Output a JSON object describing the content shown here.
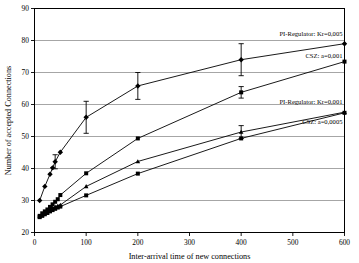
{
  "chart_data": {
    "type": "line",
    "title": "",
    "xlabel": "Inter-arrival time of new connections",
    "ylabel": "Number of accepted Connections",
    "xlim": [
      0,
      600
    ],
    "ylim": [
      20,
      90
    ],
    "xticks": [
      0,
      100,
      200,
      300,
      400,
      500,
      600
    ],
    "yticks": [
      20,
      30,
      40,
      50,
      60,
      70,
      80,
      90
    ],
    "grid": "horizontal",
    "legend_position": "inline-annotations",
    "marker_styles": [
      "diamond",
      "square",
      "triangle",
      "square"
    ],
    "series": [
      {
        "name": "PI-Regulator: Kr=0,005",
        "marker": "diamond",
        "x": [
          10,
          20,
          30,
          35,
          40,
          50,
          100,
          200,
          400,
          600
        ],
        "values": [
          30.0,
          34.4,
          38.2,
          40.2,
          42.1,
          45.1,
          56.0,
          65.8,
          74.0,
          79.0
        ],
        "yerr": [
          0,
          0,
          0,
          0,
          2.2,
          0,
          5.0,
          4.2,
          5.0,
          0
        ]
      },
      {
        "name": "CSZ: a=0,001",
        "marker": "square",
        "x": [
          10,
          15,
          20,
          25,
          30,
          35,
          40,
          45,
          50,
          100,
          200,
          400,
          600
        ],
        "values": [
          25.2,
          26.0,
          26.6,
          27.2,
          28.0,
          28.8,
          29.6,
          30.4,
          31.7,
          38.5,
          49.4,
          63.8,
          73.4
        ],
        "yerr": [
          0,
          0,
          0,
          0,
          0,
          0,
          0,
          0,
          0,
          0,
          0,
          1.8,
          0
        ]
      },
      {
        "name": "PI-Regulator: Kr=0,001",
        "marker": "triangle",
        "x": [
          10,
          15,
          20,
          25,
          30,
          35,
          40,
          45,
          50,
          100,
          200,
          400,
          600
        ],
        "values": [
          25.0,
          25.6,
          26.2,
          26.8,
          27.3,
          27.7,
          28.0,
          28.3,
          28.6,
          34.4,
          42.2,
          51.4,
          57.6
        ],
        "yerr": [
          0,
          0,
          0,
          0,
          0,
          0,
          0,
          0,
          0,
          0,
          0,
          2.0,
          0
        ]
      },
      {
        "name": "CSZ: a=0,0005",
        "marker": "square",
        "x": [
          10,
          15,
          20,
          25,
          30,
          35,
          40,
          45,
          50,
          100,
          200,
          400,
          600
        ],
        "values": [
          24.8,
          25.2,
          25.7,
          26.1,
          26.6,
          27.0,
          27.4,
          27.8,
          28.1,
          31.6,
          38.4,
          49.4,
          57.4
        ],
        "yerr": [
          0,
          0,
          0,
          0,
          0,
          0,
          0,
          0,
          0,
          0,
          0,
          0,
          0
        ]
      }
    ],
    "annotations": [
      {
        "text": "PI-Regulator: Kr=0,005",
        "x": 600,
        "y": 81.5,
        "anchor": "end"
      },
      {
        "text": "CSZ: a=0,001",
        "x": 600,
        "y": 74.6,
        "anchor": "end"
      },
      {
        "text": "PI-Regulator: Kr=0,001",
        "x": 600,
        "y": 60.2,
        "anchor": "end"
      },
      {
        "text": "CSZ: a=0,0005",
        "x": 600,
        "y": 54.0,
        "anchor": "end"
      }
    ]
  },
  "colors": {
    "axis": "#000000",
    "grid": "#808080",
    "series": "#000000",
    "background": "#ffffff"
  }
}
